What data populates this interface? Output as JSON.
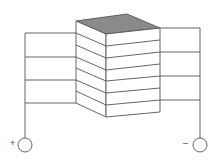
{
  "diagram": {
    "title": "",
    "colors": {
      "line": "#555555",
      "top_face": "#8a8a8a",
      "face": "#ffffff",
      "background": "#ffffff"
    },
    "stack": {
      "layer_count": 7
    },
    "terminals": {
      "positive": {
        "symbol": "+"
      },
      "negative": {
        "symbol": "–"
      }
    },
    "left_leads": 4,
    "right_leads": 4
  }
}
